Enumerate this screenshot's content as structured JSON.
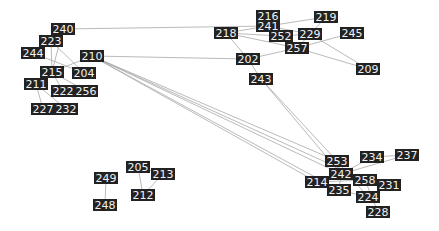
{
  "graph": {
    "type": "network",
    "node_color": "#222222",
    "label_color": "#f2f2f2",
    "edge_color": "#a8a8a8",
    "nodes": [
      {
        "id": "240",
        "x": 63,
        "y": 29
      },
      {
        "id": "223",
        "x": 51,
        "y": 41
      },
      {
        "id": "244",
        "x": 33,
        "y": 53
      },
      {
        "id": "210",
        "x": 92,
        "y": 56
      },
      {
        "id": "215",
        "x": 52,
        "y": 72
      },
      {
        "id": "204",
        "x": 84,
        "y": 73
      },
      {
        "id": "211",
        "x": 36,
        "y": 84
      },
      {
        "id": "222",
        "x": 63,
        "y": 91
      },
      {
        "id": "256",
        "x": 86,
        "y": 91
      },
      {
        "id": "227",
        "x": 43,
        "y": 109
      },
      {
        "id": "232",
        "x": 66,
        "y": 109
      },
      {
        "id": "216",
        "x": 268,
        "y": 16
      },
      {
        "id": "219",
        "x": 326,
        "y": 17
      },
      {
        "id": "241",
        "x": 268,
        "y": 26
      },
      {
        "id": "218",
        "x": 226,
        "y": 33
      },
      {
        "id": "252",
        "x": 281,
        "y": 36
      },
      {
        "id": "229",
        "x": 310,
        "y": 34
      },
      {
        "id": "245",
        "x": 352,
        "y": 33
      },
      {
        "id": "257",
        "x": 297,
        "y": 48
      },
      {
        "id": "202",
        "x": 248,
        "y": 59
      },
      {
        "id": "209",
        "x": 368,
        "y": 69
      },
      {
        "id": "243",
        "x": 261,
        "y": 79
      },
      {
        "id": "253",
        "x": 337,
        "y": 161
      },
      {
        "id": "234",
        "x": 372,
        "y": 157
      },
      {
        "id": "237",
        "x": 407,
        "y": 155
      },
      {
        "id": "242",
        "x": 341,
        "y": 174
      },
      {
        "id": "214",
        "x": 317,
        "y": 182
      },
      {
        "id": "258",
        "x": 365,
        "y": 180
      },
      {
        "id": "231",
        "x": 389,
        "y": 185
      },
      {
        "id": "235",
        "x": 339,
        "y": 190
      },
      {
        "id": "224",
        "x": 368,
        "y": 197
      },
      {
        "id": "228",
        "x": 378,
        "y": 212
      },
      {
        "id": "205",
        "x": 138,
        "y": 167
      },
      {
        "id": "213",
        "x": 163,
        "y": 174
      },
      {
        "id": "249",
        "x": 106,
        "y": 178
      },
      {
        "id": "212",
        "x": 143,
        "y": 195
      },
      {
        "id": "248",
        "x": 105,
        "y": 205
      }
    ],
    "edges": [
      [
        "240",
        "241"
      ],
      [
        "240",
        "215"
      ],
      [
        "223",
        "215"
      ],
      [
        "223",
        "204"
      ],
      [
        "244",
        "204"
      ],
      [
        "210",
        "215"
      ],
      [
        "210",
        "202"
      ],
      [
        "210",
        "253"
      ],
      [
        "210",
        "242"
      ],
      [
        "210",
        "214"
      ],
      [
        "210",
        "235"
      ],
      [
        "210",
        "258"
      ],
      [
        "215",
        "222"
      ],
      [
        "215",
        "256"
      ],
      [
        "211",
        "227"
      ],
      [
        "211",
        "232"
      ],
      [
        "216",
        "241"
      ],
      [
        "241",
        "219"
      ],
      [
        "241",
        "218"
      ],
      [
        "241",
        "229"
      ],
      [
        "218",
        "252"
      ],
      [
        "218",
        "257"
      ],
      [
        "218",
        "202"
      ],
      [
        "219",
        "229"
      ],
      [
        "229",
        "257"
      ],
      [
        "229",
        "209"
      ],
      [
        "252",
        "229"
      ],
      [
        "245",
        "257"
      ],
      [
        "257",
        "209"
      ],
      [
        "257",
        "202"
      ],
      [
        "202",
        "243"
      ],
      [
        "243",
        "242"
      ],
      [
        "243",
        "253"
      ],
      [
        "253",
        "242"
      ],
      [
        "253",
        "224"
      ],
      [
        "234",
        "237"
      ],
      [
        "234",
        "242"
      ],
      [
        "237",
        "242"
      ],
      [
        "242",
        "214"
      ],
      [
        "242",
        "258"
      ],
      [
        "242",
        "235"
      ],
      [
        "242",
        "231"
      ],
      [
        "214",
        "258"
      ],
      [
        "258",
        "231"
      ],
      [
        "258",
        "228"
      ],
      [
        "235",
        "224"
      ],
      [
        "205",
        "213"
      ],
      [
        "205",
        "212"
      ],
      [
        "213",
        "212"
      ],
      [
        "249",
        "248"
      ]
    ]
  }
}
